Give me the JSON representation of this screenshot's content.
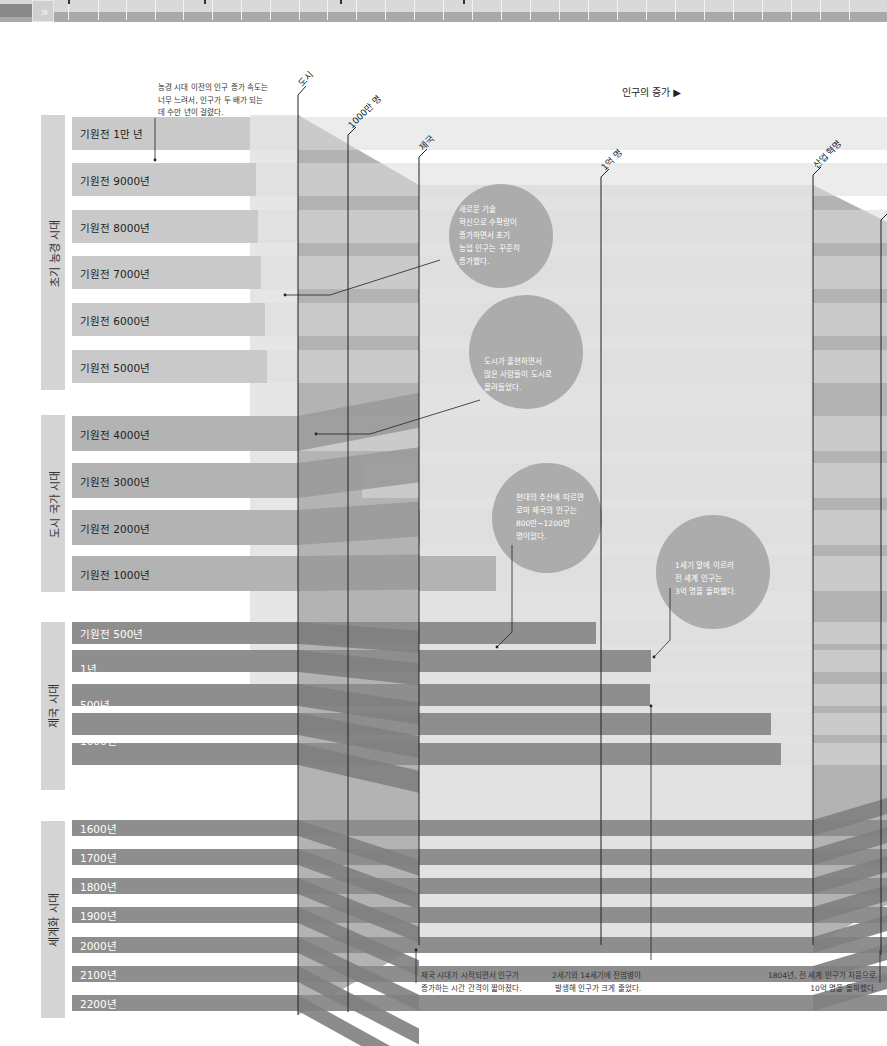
{
  "nav": {
    "next_button": "»"
  },
  "header": {
    "axis_title": "인구의 증가 ▶"
  },
  "milestones": [
    {
      "label": "도시",
      "x": 298
    },
    {
      "label": "1000만 명",
      "x": 348
    },
    {
      "label": "제국",
      "x": 419
    },
    {
      "label": "1억 명",
      "x": 601
    },
    {
      "label": "산업 혁명",
      "x": 813
    }
  ],
  "eras": [
    {
      "label": "초기 농경 시대",
      "top": 115,
      "height": 275
    },
    {
      "label": "도시 국가 시대",
      "top": 415,
      "height": 177
    },
    {
      "label": "제국 시대",
      "top": 622,
      "height": 168
    },
    {
      "label": "세계화 시대",
      "top": 821,
      "height": 197
    }
  ],
  "rows": [
    {
      "label": "기원전 1만 년",
      "y": 117,
      "h": 33,
      "end": 250,
      "tone": "light"
    },
    {
      "label": "기원전 9000년",
      "y": 163,
      "h": 33,
      "end": 256,
      "tone": "light"
    },
    {
      "label": "기원전 8000년",
      "y": 210,
      "h": 33,
      "end": 258,
      "tone": "light"
    },
    {
      "label": "기원전 7000년",
      "y": 256,
      "h": 33,
      "end": 261,
      "tone": "light"
    },
    {
      "label": "기원전 6000년",
      "y": 303,
      "h": 33,
      "end": 265,
      "tone": "light"
    },
    {
      "label": "기원전 5000년",
      "y": 350,
      "h": 33,
      "end": 267,
      "tone": "light"
    },
    {
      "label": "기원전 4000년",
      "y": 416,
      "h": 35,
      "end": 300,
      "tone": "mid"
    },
    {
      "label": "기원전 3000년",
      "y": 463,
      "h": 35,
      "end": 362,
      "tone": "mid"
    },
    {
      "label": "기원전 2000년",
      "y": 510,
      "h": 35,
      "end": 420,
      "tone": "mid"
    },
    {
      "label": "기원전 1000년",
      "y": 556,
      "h": 35,
      "end": 496,
      "tone": "mid"
    },
    {
      "label": "기원전 500년",
      "y": 622,
      "h": 22,
      "end": 596,
      "tone": "dark"
    },
    {
      "label": "1년",
      "y": 650,
      "h": 22,
      "end": 651,
      "tone": "dark"
    },
    {
      "label": "500년",
      "y": 684,
      "h": 22,
      "end": 650,
      "tone": "dark"
    },
    {
      "label": "1000년",
      "y": 713,
      "h": 22,
      "end": 771,
      "tone": "dark"
    },
    {
      "label": "1500년",
      "y": 743,
      "h": 22,
      "end": 781,
      "tone": "dark"
    },
    {
      "label": "1600년",
      "y": 820,
      "h": 16,
      "end": 887,
      "tone": "dark"
    },
    {
      "label": "1700년",
      "y": 849,
      "h": 16,
      "end": 887,
      "tone": "dark"
    },
    {
      "label": "1800년",
      "y": 878,
      "h": 16,
      "end": 887,
      "tone": "dark"
    },
    {
      "label": "1900년",
      "y": 907,
      "h": 16,
      "end": 887,
      "tone": "dark"
    },
    {
      "label": "2000년",
      "y": 937,
      "h": 16,
      "end": 887,
      "tone": "dark"
    },
    {
      "label": "2100년",
      "y": 966,
      "h": 16,
      "end": 887,
      "tone": "dark"
    },
    {
      "label": "2200년",
      "y": 995,
      "h": 16,
      "end": 887,
      "tone": "dark"
    }
  ],
  "annotations": {
    "pre_agri": [
      "농경 시대 이전의 인구 증가 속도는",
      "너무 느려서, 인구가 두 배가 되는",
      "데 수만 년이 걸렸다."
    ],
    "bubble_agri": [
      "새로운 기술",
      "혁신으로 수확량이",
      "증가하면서 초기",
      "농업 인구는 꾸준히",
      "증가했다."
    ],
    "bubble_city": [
      "도시가 출현하면서",
      "많은 사람들이 도시로",
      "몰려들었다."
    ],
    "bubble_rome": [
      "현대의 추산에 따르면",
      "로마 제국의 인구는",
      "800만~1200만",
      "명이었다."
    ],
    "bubble_1st_century": [
      "1세기 말에 이르러",
      "전 세계 인구는",
      "3억 명을 돌파했다."
    ],
    "empire_start": [
      "제국 시대가 시작되면서 인구가",
      "증가하는 시간 간격이 짧아졌다."
    ],
    "plague": [
      "2세기와 14세기에 전염병이",
      "발생해 인구가 크게 줄었다."
    ],
    "billion_1804": [
      "1804년, 전 세계 인구가 처음으로",
      "10억 명을 돌파했다."
    ]
  },
  "colors": {
    "bar_light": "#c9c9c9",
    "bar_mid": "#b3b3b3",
    "bar_dark": "#8e8e8e",
    "bubble": "#a9a9a9",
    "era_box": "#d4d4d4",
    "photo_panel": "#a4a4a4"
  },
  "chart_data": {
    "type": "bar",
    "title": "인구의 증가",
    "orientation": "horizontal",
    "xlabel": "인구의 증가 ▶",
    "ylabel": "",
    "categories": [
      "기원전 1만 년",
      "기원전 9000년",
      "기원전 8000년",
      "기원전 7000년",
      "기원전 6000년",
      "기원전 5000년",
      "기원전 4000년",
      "기원전 3000년",
      "기원전 2000년",
      "기원전 1000년",
      "기원전 500년",
      "1년",
      "500년",
      "1000년",
      "1500년",
      "1600년",
      "1700년",
      "1800년",
      "1900년",
      "2000년",
      "2100년",
      "2200년"
    ],
    "groups": [
      {
        "name": "초기 농경 시대",
        "categories": [
          "기원전 1만 년",
          "기원전 9000년",
          "기원전 8000년",
          "기원전 7000년",
          "기원전 6000년",
          "기원전 5000년"
        ]
      },
      {
        "name": "도시 국가 시대",
        "categories": [
          "기원전 4000년",
          "기원전 3000년",
          "기원전 2000년",
          "기원전 1000년"
        ]
      },
      {
        "name": "제국 시대",
        "categories": [
          "기원전 500년",
          "1년",
          "500년",
          "1000년",
          "1500년"
        ]
      },
      {
        "name": "세계화 시대",
        "categories": [
          "1600년",
          "1700년",
          "1800년",
          "1900년",
          "2000년",
          "2100년",
          "2200년"
        ]
      }
    ],
    "reference_lines": [
      "도시",
      "1000만 명",
      "제국",
      "1억 명",
      "산업 혁명"
    ],
    "approx_relative_lengths_px": [
      250,
      256,
      258,
      261,
      265,
      267,
      300,
      362,
      420,
      496,
      596,
      651,
      650,
      771,
      781,
      887,
      887,
      887,
      887,
      887,
      887,
      887
    ],
    "grid": false,
    "legend": null
  }
}
